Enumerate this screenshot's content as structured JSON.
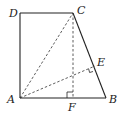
{
  "diagram": {
    "type": "geometry",
    "points": {
      "A": {
        "label": "A",
        "x": 20,
        "y": 98
      },
      "B": {
        "label": "B",
        "x": 106,
        "y": 98
      },
      "C": {
        "label": "C",
        "x": 73,
        "y": 13
      },
      "D": {
        "label": "D",
        "x": 20,
        "y": 13
      },
      "E": {
        "label": "E",
        "x": 95,
        "y": 66
      },
      "F": {
        "label": "F",
        "x": 73,
        "y": 98
      }
    },
    "solid_segments": [
      "AB",
      "BC",
      "CD",
      "DA"
    ],
    "dashed_segments": [
      "AC",
      "CF",
      "AE"
    ],
    "right_angles": [
      "CF ⟂ AB at F",
      "AE ⟂ BC at E"
    ]
  }
}
